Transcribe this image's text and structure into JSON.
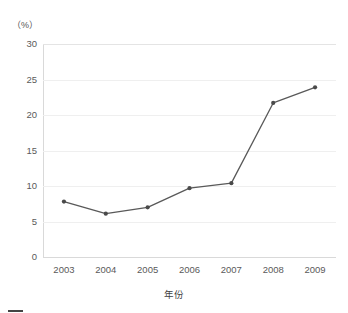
{
  "chart_data": {
    "type": "line",
    "title": "",
    "subtitle": "",
    "xlabel": "年份",
    "ylabel": "（%）",
    "y_unit_label": "（%）",
    "categories": [
      "2003",
      "2004",
      "2005",
      "2006",
      "2007",
      "2008",
      "2009"
    ],
    "x": [
      2003,
      2004,
      2005,
      2006,
      2007,
      2008,
      2009
    ],
    "values": [
      7.8,
      6.1,
      7.0,
      9.7,
      10.4,
      21.7,
      23.9
    ],
    "series": [
      {
        "name": "",
        "values": [
          7.8,
          6.1,
          7.0,
          9.7,
          10.4,
          21.7,
          23.9
        ]
      }
    ],
    "ylim": [
      0,
      30
    ],
    "yticks": [
      0,
      5,
      10,
      15,
      20,
      25,
      30
    ],
    "ytick_labels": [
      "0",
      "5",
      "10",
      "15",
      "20",
      "25",
      "30"
    ],
    "xtick_labels": [
      "2003",
      "2004",
      "2005",
      "2006",
      "2007",
      "2008",
      "2009"
    ],
    "grid": "horizontal",
    "legend": "none",
    "legend_position": "",
    "line_color": "#595959",
    "marker_color": "#4a4a4a",
    "marker": "circle",
    "gridline_color": "#efefef",
    "axis_color": "#d9d9d9",
    "tick_label_color": "#5a5a5a",
    "background_color": "#ffffff"
  },
  "caption": {
    "text": ""
  }
}
